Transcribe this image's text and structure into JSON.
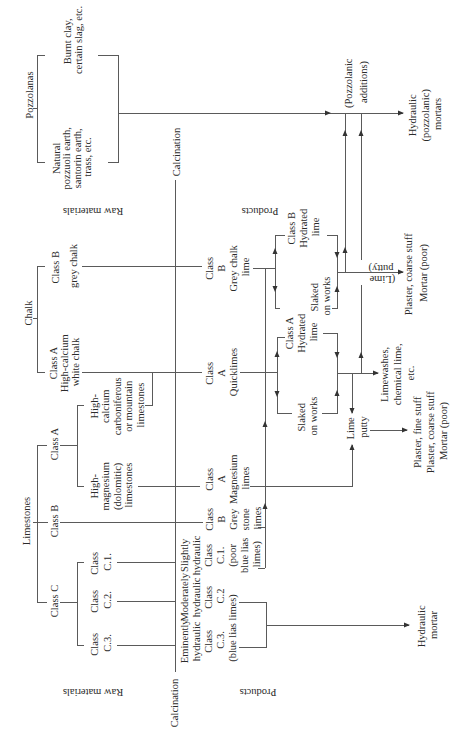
{
  "figure": {
    "labels": {
      "raw_materials_top": "Raw materials",
      "raw_materials_bottom": "Raw materials",
      "products_top": "Products",
      "products_bottom": "Products",
      "calcination_top": "Calcination",
      "calcination_bottom": "Calcination"
    },
    "raw_materials": {
      "pozzolanas": {
        "label": "Pozzolanas",
        "natural": [
          "Natural",
          "pozzuoli earth,",
          "santorin earth,",
          "trass, etc."
        ],
        "artificial": [
          "Burnt clay,",
          "certain slag, etc."
        ]
      },
      "chalk": {
        "label": "Chalk",
        "class_b": [
          "Class B",
          "grey chalk"
        ],
        "class_a": [
          "Class A",
          "High-calcium",
          "white chalk"
        ]
      },
      "limestones": {
        "label": "Limestones",
        "class_a": "Class A",
        "class_b": "Class B",
        "class_c": "Class C",
        "high_calcium": [
          "High-",
          "calcium",
          "carboniferous",
          "or mountain",
          "limestones"
        ],
        "high_magnesium": [
          "High-",
          "magnesium",
          "(dolomitic)",
          "limestones"
        ],
        "c1": [
          "Class",
          "C.1."
        ],
        "c2": [
          "Class",
          "C.2."
        ],
        "c3": [
          "Class",
          "C.3."
        ]
      }
    },
    "products": {
      "grey_chalk_lime": [
        "Class",
        "B",
        "Grey chalk",
        "lime"
      ],
      "quicklimes": [
        "Class",
        "A",
        "Quicklimes"
      ],
      "magnesium_limes": [
        "Class",
        "A",
        "Magnesium",
        "limes"
      ],
      "grey_stone_limes": [
        "Class",
        "B",
        "Grey",
        "stone",
        "limes"
      ],
      "slightly_hydraulic": [
        "Slightly",
        "hydraulic",
        "Class",
        "C.1.",
        "(poor",
        "blue lias",
        "limes)"
      ],
      "moderately_hydraulic": [
        "Moderately",
        "hydraulic",
        "Class",
        "C.2"
      ],
      "eminently_hydraulic": [
        "Eminently",
        "hydraulic",
        "Class",
        "C.3."
      ],
      "blue_lias_note": "(blue lias limes)"
    },
    "processing": {
      "class_b_hydrated": [
        "Class B",
        "Hydrated",
        "lime"
      ],
      "class_b_slaked": [
        "Slaked",
        "on works"
      ],
      "class_a_hydrated": [
        "Class A",
        "Hydrated",
        "lime"
      ],
      "class_a_slaked": [
        "Slaked",
        "on works"
      ],
      "lime_putty_note": [
        "(Lime",
        "putty)"
      ],
      "lime_putty": [
        "Lime",
        "putty"
      ],
      "pozzolanic_additions": [
        "(Pozzolanic",
        "additions)"
      ]
    },
    "end_uses": {
      "pozzolanic_mortars": [
        "Hydraulic",
        "(pozzolanic)",
        "mortars"
      ],
      "coarse_plaster": [
        "Plaster, coarse stuff",
        "Mortar (poor)"
      ],
      "limewashes": [
        "Limewashes,",
        "chemical lime,",
        "etc."
      ],
      "plasters": [
        "Plaster, fine stuff",
        "Plaster, coarse stuff",
        "Mortar (poor)"
      ],
      "hydraulic_mortar": [
        "Hydraulic",
        "mortar"
      ]
    },
    "colors": {
      "line": "#5a5a5a",
      "text": "#2b2b2b",
      "background": "#ffffff"
    }
  }
}
